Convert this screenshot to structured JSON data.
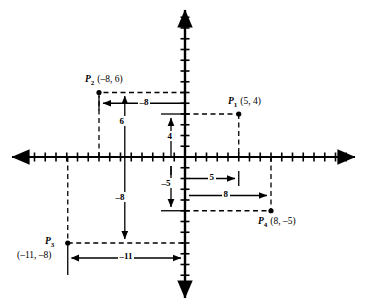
{
  "figure": {
    "background_color": "#ffffff",
    "ink_color": "#000000"
  },
  "axes": {
    "origin_px": {
      "x": 185,
      "y": 157
    },
    "unit_px": 10.75,
    "tick_half_len": 4.5,
    "x_axis": {
      "name": "x-axis",
      "left_end_px": 10,
      "right_end_px": 355,
      "tick_min": -15,
      "tick_max": 15
    },
    "y_axis": {
      "name": "y-axis",
      "top_end_px": 8,
      "bottom_end_px": 300,
      "tick_min": -13,
      "tick_max": 13
    }
  },
  "chart_data": {
    "type": "scatter",
    "title": "",
    "xlabel": "",
    "ylabel": "",
    "xlim": [
      -16,
      16
    ],
    "ylim": [
      -14,
      14
    ],
    "grid": false,
    "legend": "none",
    "points": [
      {
        "id": "P1",
        "name": "P",
        "subscript": "1",
        "x": 5,
        "y": 4,
        "label": "(5, 4)",
        "label_pos": "above-left"
      },
      {
        "id": "P2",
        "name": "P",
        "subscript": "2",
        "x": -8,
        "y": 6,
        "label": "(–8, 6)",
        "label_pos": "above-right"
      },
      {
        "id": "P3",
        "name": "P",
        "subscript": "3",
        "x": -11,
        "y": -8,
        "label": "(–11, –8)",
        "label_pos": "left-stacked"
      },
      {
        "id": "P4",
        "name": "P",
        "subscript": "4",
        "x": 8,
        "y": -5,
        "label": "(8, –5)",
        "label_pos": "below-right"
      }
    ]
  },
  "measurements": [
    {
      "id": "m-neg8-horizontal",
      "label": "–8",
      "orientation": "horizontal",
      "from": {
        "x": 0,
        "y": 5.0
      },
      "to": {
        "x": -8,
        "y": 5.0
      },
      "arrow": "end",
      "label_at": {
        "x": -3.4,
        "y": 5.0
      }
    },
    {
      "id": "m-6-vertical",
      "label": "6",
      "orientation": "vertical",
      "from": {
        "x": -5.6,
        "y": 0
      },
      "to": {
        "x": -5.6,
        "y": 6
      },
      "arrow": "end",
      "label_at": {
        "x": -5.6,
        "y": 3.0
      }
    },
    {
      "id": "m-4-vertical",
      "label": "4",
      "orientation": "vertical",
      "from": {
        "x": -1.3,
        "y": 0
      },
      "to": {
        "x": -1.3,
        "y": 4
      },
      "arrow": "end",
      "label_at": {
        "x": -1.3,
        "y": 2.0
      }
    },
    {
      "id": "m-neg8-vertical",
      "label": "–8",
      "orientation": "vertical",
      "from": {
        "x": -5.6,
        "y": 0
      },
      "to": {
        "x": -5.6,
        "y": -8
      },
      "arrow": "end",
      "label_at": {
        "x": -5.6,
        "y": -4.2
      }
    },
    {
      "id": "m-neg5-vertical",
      "label": "–5",
      "orientation": "vertical",
      "from": {
        "x": -1.3,
        "y": 0
      },
      "to": {
        "x": -1.3,
        "y": -5
      },
      "arrow": "end",
      "label_at": {
        "x": -1.3,
        "y": -2.4
      }
    },
    {
      "id": "m-5-horizontal",
      "label": "5",
      "orientation": "horizontal",
      "from": {
        "x": 0,
        "y": -2.0
      },
      "to": {
        "x": 5,
        "y": -2.0
      },
      "arrow": "end",
      "label_at": {
        "x": 2.4,
        "y": -2.0
      }
    },
    {
      "id": "m-8-horizontal",
      "label": "8",
      "orientation": "horizontal",
      "from": {
        "x": 0,
        "y": -3.6
      },
      "to": {
        "x": 8,
        "y": -3.6
      },
      "arrow": "end",
      "label_at": {
        "x": 4.0,
        "y": -3.6
      }
    },
    {
      "id": "m-neg11-horizontal",
      "label": "–11",
      "orientation": "horizontal",
      "from": {
        "x": -11,
        "y": -9.4
      },
      "to": {
        "x": 0,
        "y": -9.4
      },
      "arrow": "both",
      "label_at": {
        "x": -5.2,
        "y": -9.4
      }
    }
  ],
  "labels": {
    "p1_name": "P",
    "p1_sub": "1",
    "p1_coord": "(5, 4)",
    "p2_name": "P",
    "p2_sub": "2",
    "p2_coord": "(–8, 6)",
    "p3_name": "P",
    "p3_sub": "3",
    "p3_coord": "(–11, –8)",
    "p4_name": "P",
    "p4_sub": "4",
    "p4_coord": "(8, –5)",
    "m_neg8_h": "–8",
    "m_6": "6",
    "m_4": "4",
    "m_neg8_v": "–8",
    "m_neg5": "–5",
    "m_5": "5",
    "m_8": "8",
    "m_neg11": "–11"
  }
}
